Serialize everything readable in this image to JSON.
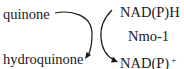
{
  "diagram": {
    "type": "redox-reaction",
    "substrate": "quinone",
    "product": "hydroquinone",
    "cofactor_in": "NAD(P)H",
    "enzyme": "Nmo-1",
    "cofactor_out_base": "NAD(P)",
    "cofactor_out_charge": "+",
    "colors": {
      "text": "#1a1a1a",
      "arrow": "#1a1a1a",
      "background": "#ffffff"
    }
  }
}
